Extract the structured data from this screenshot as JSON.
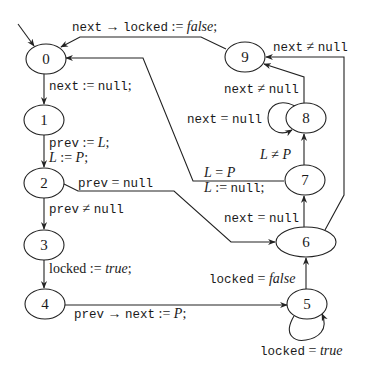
{
  "diagram": {
    "type": "state-transition-graph",
    "nodes": [
      {
        "id": "0",
        "label": "0"
      },
      {
        "id": "1",
        "label": "1"
      },
      {
        "id": "2",
        "label": "2"
      },
      {
        "id": "3",
        "label": "3"
      },
      {
        "id": "4",
        "label": "4"
      },
      {
        "id": "5",
        "label": "5"
      },
      {
        "id": "6",
        "label": "6"
      },
      {
        "id": "7",
        "label": "7"
      },
      {
        "id": "8",
        "label": "8"
      },
      {
        "id": "9",
        "label": "9"
      }
    ],
    "edges": [
      {
        "from": "start",
        "to": "0",
        "label": ""
      },
      {
        "from": "0",
        "to": "1",
        "label_parts": [
          "next",
          " := ",
          "null",
          ";"
        ]
      },
      {
        "from": "1",
        "to": "2",
        "label_parts": [
          "prev",
          " := ",
          "L",
          ";",
          "L",
          " := ",
          "P",
          ";"
        ]
      },
      {
        "from": "2",
        "to": "3",
        "label_parts": [
          "prev",
          " ≠ ",
          "null"
        ]
      },
      {
        "from": "2",
        "to": "6",
        "label_parts": [
          "prev",
          " = ",
          "null"
        ]
      },
      {
        "from": "3",
        "to": "4",
        "label_parts": [
          "locked",
          " := ",
          "true",
          ";"
        ]
      },
      {
        "from": "4",
        "to": "5",
        "label_parts": [
          "prev",
          " → ",
          "next",
          " := ",
          "P",
          ";"
        ]
      },
      {
        "from": "5",
        "to": "5",
        "label_parts": [
          "locked",
          " = ",
          "true"
        ]
      },
      {
        "from": "5",
        "to": "6",
        "label_parts": [
          "locked",
          " = ",
          "false"
        ]
      },
      {
        "from": "6",
        "to": "7",
        "label_parts": [
          "next",
          " = ",
          "null"
        ]
      },
      {
        "from": "6",
        "to": "9",
        "label_parts": [
          "next",
          " ≠ ",
          "null"
        ]
      },
      {
        "from": "7",
        "to": "8",
        "label_parts": [
          "L",
          " ≠ ",
          "P"
        ]
      },
      {
        "from": "7",
        "to": "0",
        "label_parts": [
          "L",
          " = ",
          "P",
          "L",
          " := ",
          "null",
          ";"
        ]
      },
      {
        "from": "8",
        "to": "8",
        "label_parts": [
          "next",
          " = ",
          "null"
        ]
      },
      {
        "from": "8",
        "to": "9",
        "label_parts": [
          "next",
          " ≠ ",
          "null"
        ]
      },
      {
        "from": "9",
        "to": "0",
        "label_parts": [
          "next",
          " → ",
          "locked",
          " := ",
          "false",
          ";"
        ]
      }
    ]
  }
}
